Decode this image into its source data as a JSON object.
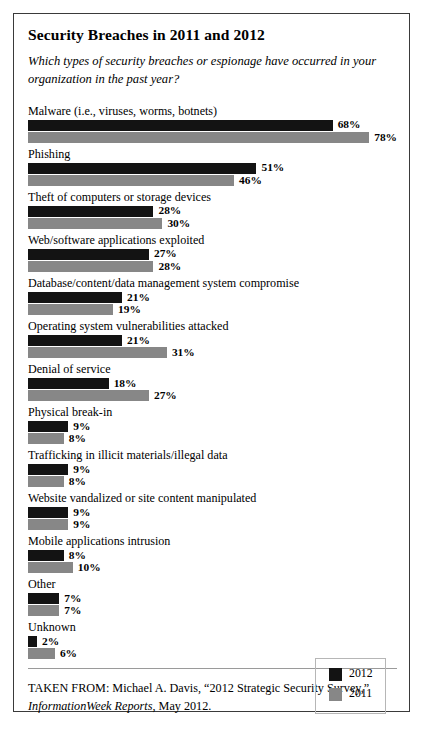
{
  "chart_data": {
    "type": "bar",
    "title": "Security Breaches in 2011 and 2012",
    "subtitle": "Which types of security breaches or espionage have occurred in your organization in the past year?",
    "orientation": "horizontal",
    "xlabel": "",
    "ylabel": "",
    "xlim": [
      0,
      80
    ],
    "grid": false,
    "value_suffix": "%",
    "legend_position": "bottom-right",
    "categories": [
      "Malware (i.e., viruses, worms, botnets)",
      "Phishing",
      "Theft of computers or storage devices",
      "Web/software applications exploited",
      "Database/content/data management system compromise",
      "Operating system vulnerabilities attacked",
      "Denial of service",
      "Physical break-in",
      "Trafficking in illicit materials/illegal data",
      "Website vandalized or site content manipulated",
      "Mobile applications intrusion",
      "Other",
      "Unknown"
    ],
    "series": [
      {
        "name": "2012",
        "color": "#131313",
        "values": [
          68,
          51,
          28,
          27,
          21,
          21,
          18,
          9,
          9,
          9,
          8,
          7,
          2
        ],
        "labels": [
          "68%",
          "51%",
          "28%",
          "27%",
          "21%",
          "21%",
          "18%",
          "9%",
          "9%",
          "9%",
          "8%",
          "7%",
          "2%"
        ]
      },
      {
        "name": "2011",
        "color": "#878787",
        "values": [
          78,
          46,
          30,
          28,
          19,
          31,
          27,
          8,
          8,
          9,
          10,
          7,
          6
        ],
        "labels": [
          "78%",
          "46%",
          "30%",
          "28%",
          "19%",
          "31%",
          "27%",
          "8%",
          "8%",
          "9%",
          "10%",
          "7%",
          "6%"
        ]
      }
    ]
  },
  "legend": {
    "entries": [
      {
        "label": "2012",
        "color": "#131313"
      },
      {
        "label": "2011",
        "color": "#878787"
      }
    ]
  },
  "source": {
    "prefix": "TAKEN FROM: Michael A. Davis, “2012 Strategic Security Survey,” ",
    "publication": "InformationWeek Reports",
    "suffix": ", May 2012."
  }
}
